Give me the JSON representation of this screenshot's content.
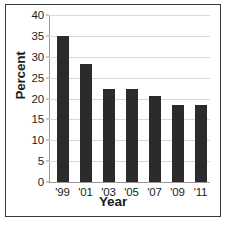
{
  "figure": {
    "background_color": "#ffffff",
    "border_color": "#3a3a3a"
  },
  "chart_data": {
    "type": "bar",
    "title": "",
    "subtitle": "",
    "xlabel": "Year",
    "ylabel": "Percent",
    "categories": [
      "'99",
      "'01",
      "'03",
      "'05",
      "'07",
      "'09",
      "'11"
    ],
    "values": [
      35.0,
      28.3,
      22.2,
      22.2,
      20.5,
      18.4,
      18.4
    ],
    "ylim": [
      0,
      40
    ],
    "yticks": [
      0,
      5,
      10,
      15,
      20,
      25,
      30,
      35,
      40
    ],
    "ytick_labels": [
      "0",
      "5",
      "10",
      "15",
      "20",
      "25",
      "30",
      "35",
      "40"
    ],
    "grid": true,
    "grid_axis": "y",
    "grid_color": "#d9d9d9",
    "legend": false,
    "legend_position": "none",
    "bar_color": "#2b2b2b",
    "axis_color": "#9a9a9a",
    "annotations": []
  }
}
